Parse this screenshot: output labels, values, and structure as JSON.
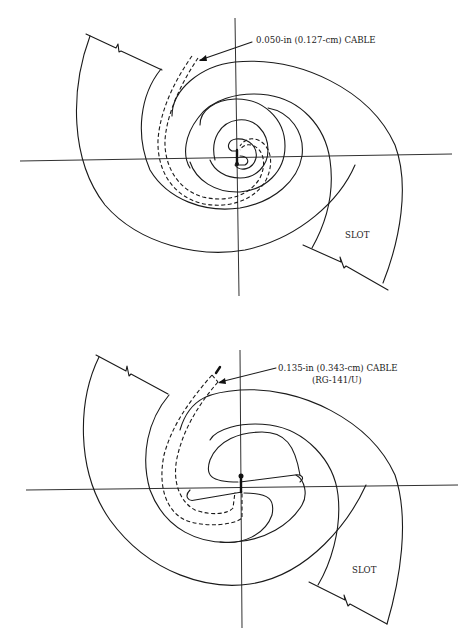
{
  "figure": {
    "top_diagram": {
      "cable_label": "0.050-in (0.127-cm) CABLE",
      "slot_label": "SLOT"
    },
    "bottom_diagram": {
      "cable_label_line1": "0.135-in (0.343-cm) CABLE",
      "cable_label_line2": "(RG-141/U)",
      "slot_label": "SLOT"
    }
  }
}
